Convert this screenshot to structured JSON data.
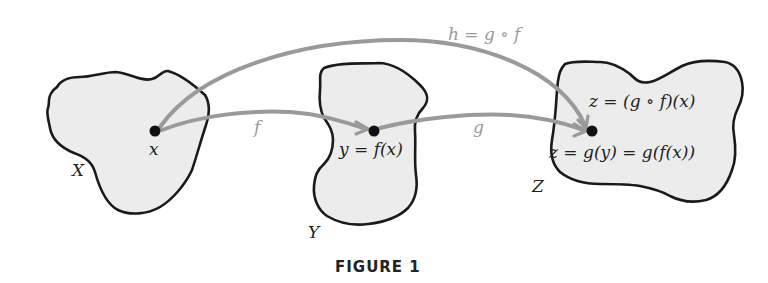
{
  "figure": {
    "caption": "FIGURE 1",
    "sets": [
      {
        "name": "X",
        "point_label": "x"
      },
      {
        "name": "Y",
        "point_label": "y = f(x)"
      },
      {
        "name": "Z",
        "point_label_top": "z = (g ∘ f)(x)",
        "point_label_bottom": "z = g(y) = g(f(x))"
      }
    ],
    "arrows": [
      {
        "label": "f",
        "from": "x",
        "to": "y"
      },
      {
        "label": "g",
        "from": "y",
        "to": "z"
      },
      {
        "label": "h = g ∘ f",
        "from": "x",
        "to": "z"
      }
    ],
    "colors": {
      "region_fill": "#ececec",
      "region_stroke": "#1a1a1a",
      "arrow": "#9a9a9a",
      "point": "#111111"
    }
  }
}
